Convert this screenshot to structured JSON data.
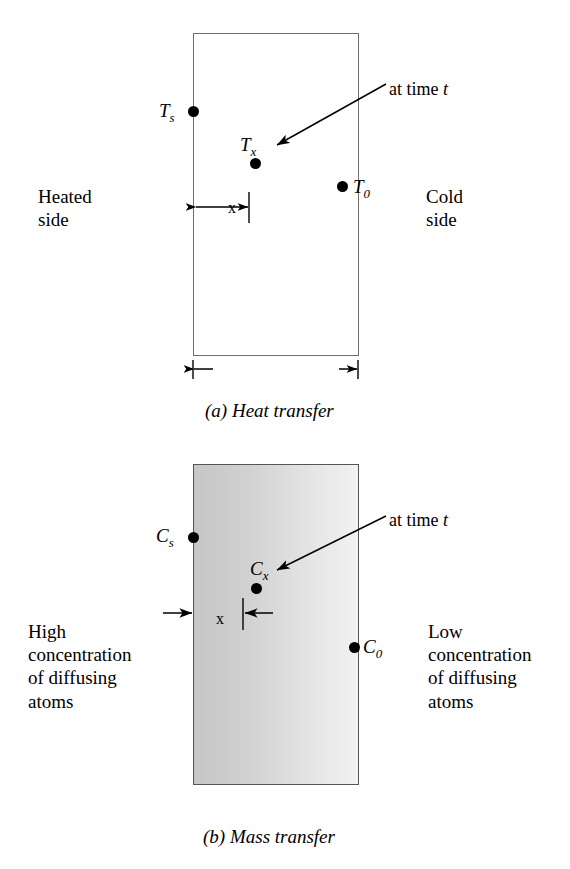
{
  "figure": {
    "type": "schematic-diagram",
    "title_a": "(a) Heat transfer",
    "title_b": "(b) Mass transfer"
  },
  "panel_a": {
    "caption": "(a) Heat transfer",
    "left_side_label": "Heated\nside",
    "left_side_lines": [
      "Heated",
      "side"
    ],
    "right_side_lines": [
      "Cold",
      "side"
    ],
    "surface_symbol": "T",
    "surface_sub": "s",
    "interior_symbol": "T",
    "interior_sub": "x",
    "far_symbol": "T",
    "far_sub": "0",
    "arrow_note": "at time ",
    "arrow_note_italic": "t",
    "distance_label": "x",
    "thickness_label": "wall thickness"
  },
  "panel_b": {
    "caption": "(b) Mass transfer",
    "left_side_lines": [
      "High",
      "concentration",
      "of diffusing",
      "atoms"
    ],
    "right_side_lines": [
      "Low",
      "concentration",
      "of diffusing",
      "atoms"
    ],
    "surface_symbol": "C",
    "surface_sub": "s",
    "interior_symbol": "C",
    "interior_sub": "x",
    "far_symbol": "C",
    "far_sub": "0",
    "arrow_note": "at time ",
    "arrow_note_italic": "t",
    "distance_label": "x"
  },
  "colors": {
    "ink": "#000000",
    "wall_outline_a": "#6e6e6e",
    "wall_outline_b": "#555555",
    "gradient_high": "#c6c6c6",
    "gradient_low": "#f2f2f2",
    "background": "#ffffff"
  }
}
